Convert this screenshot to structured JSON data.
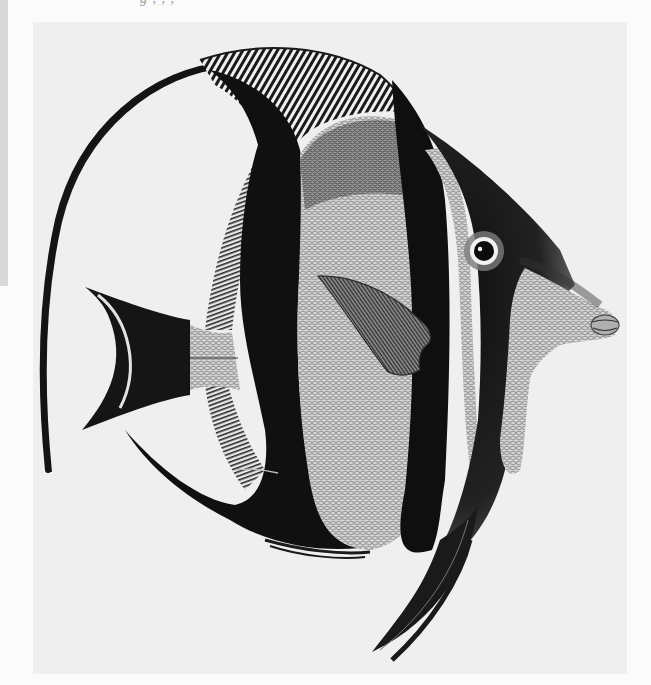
{
  "page": {
    "top_caption_cutoff": "g             ,                    ,  ,",
    "background_color": "#fbfbfb",
    "plate_color": "#efefef"
  },
  "illustration": {
    "subject": "Moorish-idol / bannerfish style butterflyfish engraving",
    "style": "black and white engraved plate",
    "features": [
      "long trailing dorsal filament",
      "striped dorsal fin rays",
      "forked black caudal fin with pale crescent",
      "three broad black vertical bands",
      "scaled pale body",
      "pectoral fin with fine rays",
      "round eye with white iris ring",
      "protruding snout with lips",
      "black pelvic fin pointing downward"
    ],
    "colors": {
      "band_black": "#111111",
      "body_light": "#cfcfcf",
      "scale_line": "#7a7a7a",
      "eye_ring": "#f2f2f2"
    }
  }
}
